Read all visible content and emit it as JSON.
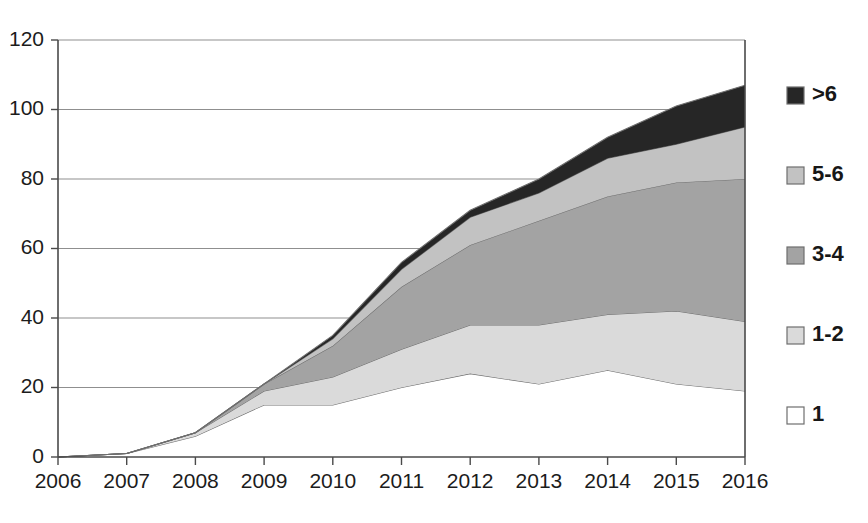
{
  "chart_data": {
    "type": "area",
    "stacked": true,
    "title": "",
    "xlabel": "",
    "ylabel": "",
    "categories": [
      "2006",
      "2007",
      "2008",
      "2009",
      "2010",
      "2011",
      "2012",
      "2013",
      "2014",
      "2015",
      "2016"
    ],
    "x": [
      2006,
      2007,
      2008,
      2009,
      2010,
      2011,
      2012,
      2013,
      2014,
      2015,
      2016
    ],
    "xlim": [
      2006,
      2016
    ],
    "ylim": [
      0,
      120
    ],
    "yticks": [
      0,
      20,
      40,
      60,
      80,
      100,
      120
    ],
    "ytick_labels": [
      "0",
      "20",
      "40",
      "60",
      "80",
      "100",
      "120"
    ],
    "xtick_labels": [
      "2006",
      "2007",
      "2008",
      "2009",
      "2010",
      "2011",
      "2012",
      "2013",
      "2014",
      "2015",
      "2016"
    ],
    "grid": true,
    "grid_axis": "y",
    "legend_position": "right",
    "series": [
      {
        "name": "1",
        "color": "#ffffff",
        "values": [
          0,
          1,
          6,
          15,
          15,
          20,
          24,
          21,
          25,
          21,
          19
        ]
      },
      {
        "name": "1-2",
        "color": "#dadada",
        "values": [
          0,
          0,
          1,
          4,
          8,
          11,
          14,
          17,
          16,
          21,
          20
        ]
      },
      {
        "name": "3-4",
        "color": "#a3a3a3",
        "values": [
          0,
          0,
          0,
          2,
          9,
          18,
          23,
          30,
          34,
          37,
          41
        ]
      },
      {
        "name": "5-6",
        "color": "#c2c2c2",
        "values": [
          0,
          0,
          0,
          0,
          2,
          5,
          8,
          8,
          11,
          11,
          15
        ]
      },
      {
        ">6_note": "topmost band",
        "name": ">6",
        "color": "#262626",
        "values": [
          0,
          0,
          0,
          0,
          1,
          2,
          2,
          4,
          6,
          11,
          12
        ]
      }
    ],
    "cumulative_tops": {
      "1": [
        0,
        1,
        6,
        15,
        15,
        20,
        24,
        21,
        25,
        21,
        19
      ],
      "1-2": [
        0,
        1,
        7,
        19,
        23,
        31,
        38,
        38,
        41,
        42,
        39
      ],
      "3-4": [
        0,
        1,
        7,
        21,
        32,
        49,
        61,
        68,
        75,
        79,
        80
      ],
      "5-6": [
        0,
        1,
        7,
        21,
        34,
        54,
        69,
        76,
        86,
        90,
        95
      ],
      ">6": [
        0,
        1,
        7,
        21,
        35,
        56,
        71,
        80,
        92,
        101,
        107
      ]
    },
    "totals": [
      0,
      1,
      7,
      21,
      35,
      56,
      71,
      80,
      92,
      101,
      107
    ]
  },
  "legend": {
    "entries": [
      {
        "label": ">6",
        "color": "#262626"
      },
      {
        "label": "5-6",
        "color": "#c2c2c2"
      },
      {
        "label": "3-4",
        "color": "#a3a3a3"
      },
      {
        "label": "1-2",
        "color": "#dadada"
      },
      {
        "label": "1",
        "color": "#ffffff"
      }
    ]
  },
  "axes": {
    "y_tick_labels": [
      "120",
      "100",
      "80",
      "60",
      "40",
      "20",
      "0"
    ],
    "x_tick_labels": [
      "2006",
      "2007",
      "2008",
      "2009",
      "2010",
      "2011",
      "2012",
      "2013",
      "2014",
      "2015",
      "2016"
    ]
  }
}
